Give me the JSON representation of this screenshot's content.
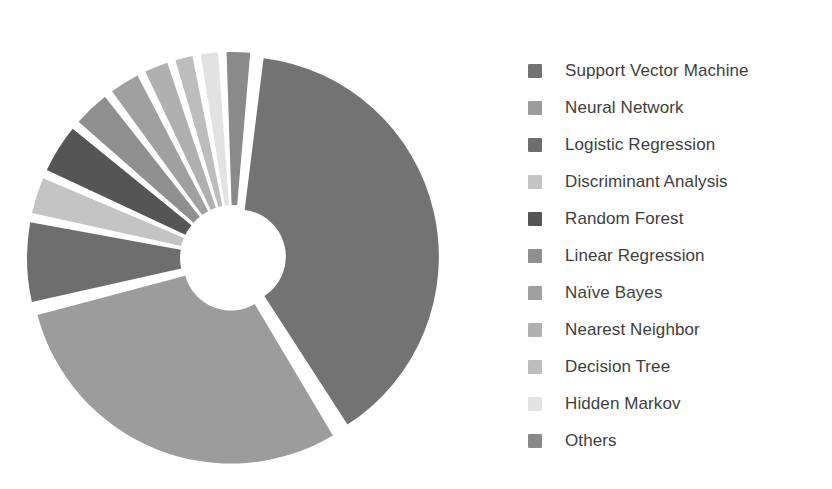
{
  "chart_data": {
    "type": "pie",
    "title": "",
    "subtitle": "",
    "xlabel": "",
    "ylabel": "",
    "variant": "donut-exploded",
    "legend_position": "right",
    "grid": false,
    "start_angle_deg": 6,
    "direction": "clockwise",
    "inner_radius_ratio": 0.235,
    "explode_gap_deg": 2.2,
    "categories": [
      "Support Vector Machine",
      "Neural Network",
      "Logistic Regression",
      "Discriminant Analysis",
      "Random Forest",
      "Linear Regression",
      "Naïve Bayes",
      "Nearest Neighbor",
      "Decision Tree",
      "Hidden Markov",
      "Others"
    ],
    "values": [
      39.5,
      30.0,
      7.0,
      3.5,
      4.5,
      3.5,
      3.0,
      2.5,
      2.0,
      2.0,
      2.5
    ],
    "colors": [
      "#737373",
      "#9c9c9c",
      "#6e6e6e",
      "#c4c4c4",
      "#555555",
      "#8f8f8f",
      "#a0a0a0",
      "#b0b0b0",
      "#bdbdbd",
      "#e2e2e2",
      "#8a8a8a"
    ]
  },
  "legend": {
    "items": [
      {
        "label": "Support Vector Machine",
        "color": "#737373"
      },
      {
        "label": "Neural Network",
        "color": "#9c9c9c"
      },
      {
        "label": "Logistic Regression",
        "color": "#6e6e6e"
      },
      {
        "label": "Discriminant Analysis",
        "color": "#c4c4c4"
      },
      {
        "label": "Random Forest",
        "color": "#555555"
      },
      {
        "label": "Linear Regression",
        "color": "#8f8f8f"
      },
      {
        "label": "Naïve Bayes",
        "color": "#a0a0a0"
      },
      {
        "label": "Nearest Neighbor",
        "color": "#b0b0b0"
      },
      {
        "label": "Decision Tree",
        "color": "#bdbdbd"
      },
      {
        "label": "Hidden Markov",
        "color": "#e2e2e2"
      },
      {
        "label": "Others",
        "color": "#8a8a8a"
      }
    ]
  }
}
